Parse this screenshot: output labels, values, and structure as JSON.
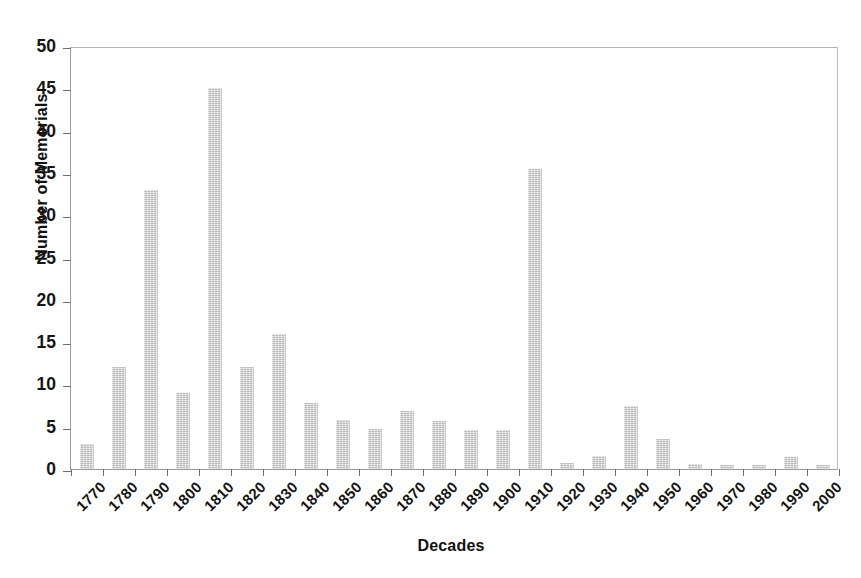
{
  "chart_data": {
    "type": "bar",
    "title": "",
    "xlabel": "Decades",
    "ylabel": "Number of Memorials",
    "categories": [
      "1770",
      "1780",
      "1790",
      "1800",
      "1810",
      "1820",
      "1830",
      "1840",
      "1850",
      "1860",
      "1870",
      "1880",
      "1890",
      "1900",
      "1910",
      "1920",
      "1930",
      "1940",
      "1950",
      "1960",
      "1970",
      "1980",
      "1990",
      "2000"
    ],
    "values": [
      3,
      12,
      33,
      9,
      45,
      12,
      16,
      7.8,
      5.8,
      4.7,
      6.8,
      5.7,
      4.6,
      4.6,
      35.5,
      0.7,
      1.5,
      7.5,
      3.5,
      0.6,
      0.5,
      0.5,
      1.4,
      0.5
    ],
    "ylim": [
      0,
      50
    ],
    "yticks": [
      0,
      5,
      10,
      15,
      20,
      25,
      30,
      35,
      40,
      45,
      50
    ],
    "ytick_labels": [
      "0",
      "5",
      "10",
      "15",
      "20",
      "25",
      "30",
      "35",
      "40",
      "45",
      "50"
    ],
    "grid": false,
    "legend": null,
    "bar_color": "#c9c9c9",
    "axis_color": "#6e6e6e",
    "text_color": "#151515"
  }
}
